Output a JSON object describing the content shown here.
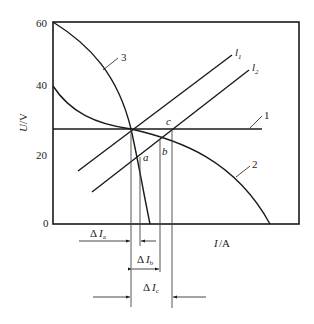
{
  "diagram": {
    "y_axis": {
      "label_var": "U",
      "label_unit": "/V",
      "ticks": [
        "60",
        "40",
        "20",
        "0"
      ]
    },
    "x_axis": {
      "label_var": "I",
      "label_unit": "/A"
    },
    "curve_labels": {
      "c1": "1",
      "c2": "2",
      "c3": "3"
    },
    "line_labels": {
      "l1": "l",
      "l1_sub": "1",
      "l2": "l",
      "l2_sub": "2"
    },
    "points": {
      "a": "a",
      "b": "b",
      "c": "c"
    },
    "deltas": {
      "a": {
        "delta": "Δ",
        "var": "I",
        "sub": "a"
      },
      "b": {
        "delta": "Δ",
        "var": "I",
        "sub": "b"
      },
      "c": {
        "delta": "Δ",
        "var": "I",
        "sub": "c"
      }
    },
    "colors": {
      "line": "#1a1a1a",
      "thin": "#444444"
    }
  }
}
